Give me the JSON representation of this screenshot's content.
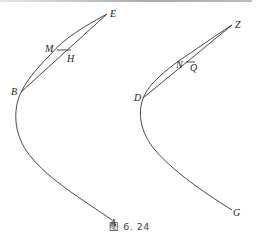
{
  "figure": {
    "caption": "图 6. 24",
    "stroke_color": "#333333",
    "left_curve": {
      "points": {
        "E": {
          "label": "E",
          "x": 107,
          "y": 14
        },
        "M": {
          "label": "M",
          "x": 57,
          "y": 50
        },
        "H": {
          "label": "H",
          "x": 71,
          "y": 57
        },
        "B": {
          "label": "B",
          "x": 21,
          "y": 92
        },
        "A": {
          "label": "A",
          "x": 112,
          "y": 220
        }
      },
      "segments": [
        "E-B",
        "M-H",
        "M-E"
      ]
    },
    "right_curve": {
      "points": {
        "Z": {
          "label": "Z",
          "x": 232,
          "y": 25
        },
        "N": {
          "label": "N",
          "x": 189,
          "y": 63
        },
        "Q": {
          "label": "Q",
          "x": 197,
          "y": 66
        },
        "D": {
          "label": "D",
          "x": 143,
          "y": 98
        },
        "G": {
          "label": "G",
          "x": 232,
          "y": 210
        }
      },
      "segments": [
        "Z-D",
        "N-Q"
      ]
    }
  }
}
